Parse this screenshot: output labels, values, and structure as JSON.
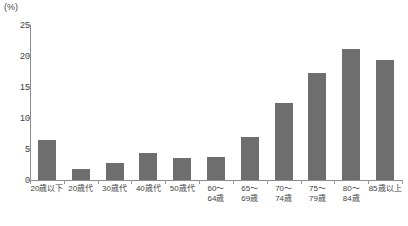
{
  "chart_data": {
    "type": "bar",
    "title": "",
    "xlabel": "",
    "ylabel": "(%)",
    "unit_label": "(%)",
    "ylim": [
      0,
      25
    ],
    "ytick_values": [
      0,
      5,
      10,
      15,
      20,
      25
    ],
    "ytick_labels": [
      "0",
      "5",
      "10",
      "15",
      "20",
      "25"
    ],
    "grid": false,
    "legend": null,
    "bar_color": "#6e6e6e",
    "axis_color": "#8c8c8c",
    "categories": [
      "20歳以下",
      "20歳代",
      "30歳代",
      "40歳代",
      "50歳代",
      "60〜64歳",
      "65〜69歳",
      "70〜74歳",
      "75〜79歳",
      "80〜84歳",
      "85歳以上"
    ],
    "category_lines": [
      [
        "20歳以下",
        ""
      ],
      [
        "20歳代",
        ""
      ],
      [
        "30歳代",
        ""
      ],
      [
        "40歳代",
        ""
      ],
      [
        "50歳代",
        ""
      ],
      [
        "60〜",
        "64歳"
      ],
      [
        "65〜",
        "69歳"
      ],
      [
        "70〜",
        "74歳"
      ],
      [
        "75〜",
        "79歳"
      ],
      [
        "80〜",
        "84歳"
      ],
      [
        "85歳以上",
        ""
      ]
    ],
    "values": [
      6.4,
      1.8,
      2.7,
      4.3,
      3.6,
      3.7,
      7.0,
      12.5,
      17.2,
      21.2,
      19.3
    ]
  }
}
